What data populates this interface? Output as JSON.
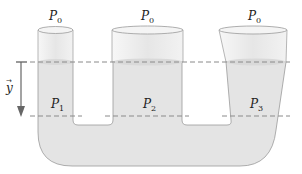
{
  "diagram": {
    "containers": [
      {
        "name": "left-cylinder",
        "top_pressure": "P",
        "top_pressure_sub": "0",
        "depth_pressure": "P",
        "depth_pressure_sub": "1"
      },
      {
        "name": "middle-cylinder",
        "top_pressure": "P",
        "top_pressure_sub": "0",
        "depth_pressure": "P",
        "depth_pressure_sub": "2"
      },
      {
        "name": "right-cone",
        "top_pressure": "P",
        "top_pressure_sub": "0",
        "depth_pressure": "P",
        "depth_pressure_sub": "3"
      }
    ],
    "axis": {
      "label": "y",
      "vector_mark": "→",
      "direction": "down"
    },
    "colors": {
      "liquid": "#e4e4e4",
      "liquid_dark": "#d6d6d6",
      "empty_tube": "#f2f2f2",
      "outline": "#9a9a9a",
      "dashed_line": "#8a8a8a",
      "arrow": "#666666"
    }
  }
}
